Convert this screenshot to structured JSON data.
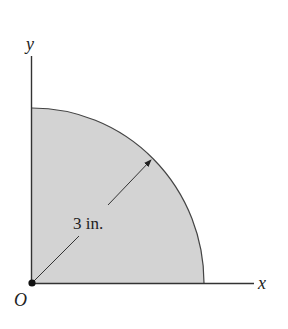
{
  "figure": {
    "axes": {
      "x_label": "x",
      "y_label": "y",
      "origin_label": "O"
    },
    "dimension": {
      "radius_label": "3 in."
    },
    "colors": {
      "fill": "#d3d3d3",
      "stroke": "#333333"
    }
  }
}
